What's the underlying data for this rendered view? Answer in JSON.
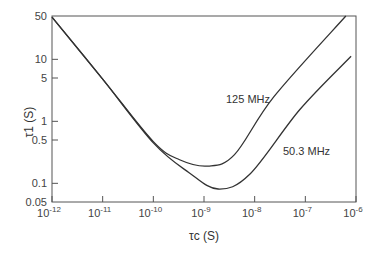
{
  "chart_data": {
    "type": "line",
    "title": "",
    "xlabel": "τc (S)",
    "ylabel": "τ1 (S)",
    "xscale": "log",
    "yscale": "log",
    "xlim": [
      1e-12,
      1e-06
    ],
    "ylim": [
      0.05,
      50
    ],
    "grid": false,
    "legend_position": "inline labels",
    "x_ticks": [
      {
        "base": "10",
        "exp": "-12",
        "value": 1e-12
      },
      {
        "base": "10",
        "exp": "-11",
        "value": 1e-11
      },
      {
        "base": "10",
        "exp": "-10",
        "value": 1e-10
      },
      {
        "base": "10",
        "exp": "-9",
        "value": 1e-09
      },
      {
        "base": "10",
        "exp": "-8",
        "value": 1e-08
      },
      {
        "base": "10",
        "exp": "-7",
        "value": 1e-07
      },
      {
        "base": "10",
        "exp": "-6",
        "value": 1e-06
      }
    ],
    "y_ticks": [
      {
        "label": "50",
        "value": 50
      },
      {
        "label": "10",
        "value": 10
      },
      {
        "label": "5",
        "value": 5
      },
      {
        "label": "1",
        "value": 1
      },
      {
        "label": "0.5",
        "value": 0.5
      },
      {
        "label": "0.1",
        "value": 0.1
      },
      {
        "label": "0.05",
        "value": 0.05
      }
    ],
    "series": [
      {
        "name": "125 MHz",
        "label": "125 MHz",
        "x": [
          1e-12,
          1e-11,
          1e-10,
          3.3e-10,
          1.2e-09,
          4e-09,
          2.4e-08,
          6.3e-07
        ],
        "y": [
          48,
          4.8,
          0.47,
          0.24,
          0.19,
          0.29,
          2.5,
          50
        ]
      },
      {
        "name": "50.3 MHz",
        "label": "50.3 MHz",
        "x": [
          1e-12,
          1e-11,
          1e-10,
          5e-10,
          1.9e-09,
          8e-09,
          7.8e-08,
          8e-07
        ],
        "y": [
          48,
          4.8,
          0.45,
          0.15,
          0.081,
          0.14,
          1.55,
          11.2
        ]
      }
    ]
  }
}
